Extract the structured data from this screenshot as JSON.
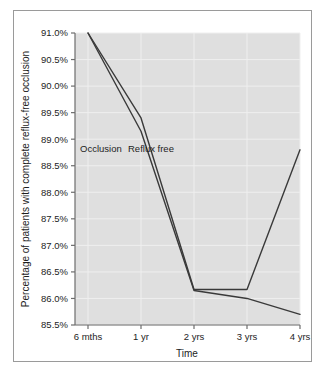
{
  "chart_data": {
    "type": "line",
    "title": "",
    "xlabel": "Time",
    "ylabel": "Percentage of patients with complete reflux-free occlusion",
    "categories": [
      "6 mths",
      "1 yr",
      "2 yrs",
      "3 yrs",
      "4 yrs"
    ],
    "x_tick_labels": [
      "6 mths",
      "1 yr",
      "2 yrs",
      "3 yrs",
      "4 yrs"
    ],
    "y_tick_labels": [
      "91.0%",
      "90.5%",
      "90.0%",
      "89.5%",
      "89.0%",
      "88.5%",
      "88.0%",
      "87.5%",
      "87.0%",
      "86.5%",
      "86.0%",
      "85.5%"
    ],
    "y_tick_values": [
      91.0,
      90.5,
      90.0,
      89.5,
      89.0,
      88.5,
      88.0,
      87.5,
      87.0,
      86.5,
      86.0,
      85.5
    ],
    "ylim": [
      85.5,
      91.0
    ],
    "grid": true,
    "legend_position": "inline-annotations",
    "series": [
      {
        "name": "Occlusion",
        "values": [
          91.0,
          89.4,
          86.17,
          86.17,
          88.8
        ],
        "color": "#3a3a3a",
        "annotation": "Occlusion"
      },
      {
        "name": "Reflux free",
        "values": [
          91.0,
          89.15,
          86.15,
          86.0,
          85.7
        ],
        "color": "#3a3a3a",
        "annotation": "Reflux free"
      }
    ],
    "annotations": [
      {
        "text": "Occlusion",
        "series": "Occlusion"
      },
      {
        "text": "Reflux free",
        "series": "Reflux free"
      }
    ],
    "colors": {
      "plot_background": "#dfdfdf",
      "grid": "#efefef",
      "line": "#3a3a3a",
      "axis": "#6d6d6d",
      "text": "#1d1d1d",
      "figure_background": "#ffffff",
      "frame_border": "#9a9a9a"
    }
  }
}
